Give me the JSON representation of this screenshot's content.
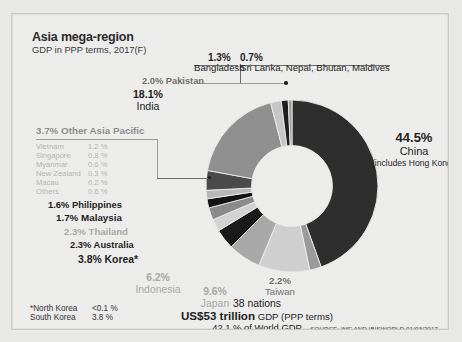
{
  "header": {
    "title": "Asia mega-region",
    "subtitle": "GDP in PPP terms, 2017(F)"
  },
  "labels": {
    "bangladesh_pct": "1.3%",
    "bangladesh_name": "Bangladesh",
    "srilanka_pct": "0.7%",
    "srilanka_name": "Sri Lanka, Nepal, Bhutan, Maldives",
    "pakistan": "2.0% Pakistan",
    "india_pct": "18.1%",
    "india_name": "India",
    "china_pct": "44.5%",
    "china_name": "China",
    "china_note": "(includes Hong Kong 0.9 % )",
    "other_asia_pacific": "3.7%  Other Asia Pacific",
    "philippines": "1.6% Philippines",
    "malaysia": "1.7% Malaysia",
    "thailand": "2.3% Thailand",
    "australia": "2.3% Australia",
    "korea": "3.8% Korea*",
    "indonesia_pct": "6.2%",
    "indonesia_name": "Indonesia",
    "japan_pct": "9.6%",
    "japan_name": "Japan",
    "taiwan_pct": "2.2%",
    "taiwan_name": "Taiwan"
  },
  "other_asia_pacific_breakdown": [
    {
      "name": "Vietnam",
      "value": "1.2 %"
    },
    {
      "name": "Singapore",
      "value": "0.8 %"
    },
    {
      "name": "Myanmar",
      "value": "0.6 %"
    },
    {
      "name": "New Zealand",
      "value": "0.3 %"
    },
    {
      "name": "Macau",
      "value": "0.2 %"
    },
    {
      "name": "Others",
      "value": "0.6 %"
    }
  ],
  "footnote": [
    {
      "name": "*North Korea",
      "value": "<0.1 %"
    },
    {
      "name": "South Korea",
      "value": "3.8 %"
    }
  ],
  "summary": {
    "nations": "38 nations",
    "total": "US$53 trillion",
    "total_suffix": " GDP (PPP terms)",
    "world_share": "42.1 %  of World GDP"
  },
  "source": "SOURCE: IMF AND IBISWORLD 01/03/2017",
  "chart_data": {
    "type": "pie",
    "title": "Asia mega-region",
    "subtitle": "GDP in PPP terms, 2017(F)",
    "donut": true,
    "inner_radius_ratio": 0.47,
    "start_angle_deg": 0,
    "direction": "clockwise",
    "unit": "percent",
    "total_label": "US$53 trillion GDP (PPP terms), 42.1 % of World GDP, 38 nations",
    "categories": [
      "China",
      "Taiwan",
      "Japan",
      "Indonesia",
      "Korea",
      "Australia",
      "Thailand",
      "Malaysia",
      "Philippines",
      "Other Asia Pacific",
      "India",
      "Pakistan",
      "Bangladesh",
      "Sri Lanka, Nepal, Bhutan, Maldives"
    ],
    "values": [
      44.5,
      2.2,
      9.6,
      6.2,
      3.8,
      2.3,
      2.3,
      1.7,
      1.6,
      3.7,
      18.1,
      2.0,
      1.3,
      0.7
    ],
    "colors": [
      "#2e2e2e",
      "#9a9a9a",
      "#cfcfcf",
      "#a9a9a9",
      "#1a1a1a",
      "#d2d2d2",
      "#8a8a8a",
      "#121212",
      "#b8b8b8",
      "#4a4a4a",
      "#8f8f8f",
      "#c6c6c6",
      "#1e1e1e",
      "#a0a0a0"
    ],
    "annotations": [
      "China includes Hong Kong 0.9 %",
      "*North Korea <0.1 %, South Korea 3.8 %"
    ]
  }
}
